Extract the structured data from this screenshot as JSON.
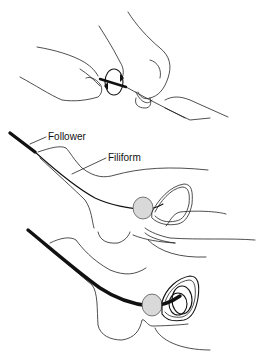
{
  "figure": {
    "panels": [
      {
        "id": "panel-1",
        "description": "Hands screwing follower onto filiform (rotation arrows)"
      },
      {
        "id": "panel-2",
        "description": "Filiform with follower advanced into urethra toward bladder"
      },
      {
        "id": "panel-3",
        "description": "Follower advanced into bladder"
      }
    ],
    "labels": {
      "follower": "Follower",
      "filiform": "Filiform"
    },
    "colors": {
      "line": "#111111",
      "background": "#ffffff",
      "stipple": "#d9d9d9"
    }
  }
}
